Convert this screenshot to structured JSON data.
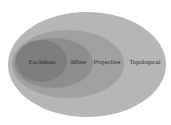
{
  "diagram": {
    "type": "nested-sets",
    "sets": [
      {
        "label": "Topological",
        "color": "#b4b4b4"
      },
      {
        "label": "Projective",
        "color": "#9e9e9e"
      },
      {
        "label": "Affine",
        "color": "#8c8c8c"
      },
      {
        "label": "Euclidean",
        "color": "#7d7d7d"
      }
    ]
  }
}
